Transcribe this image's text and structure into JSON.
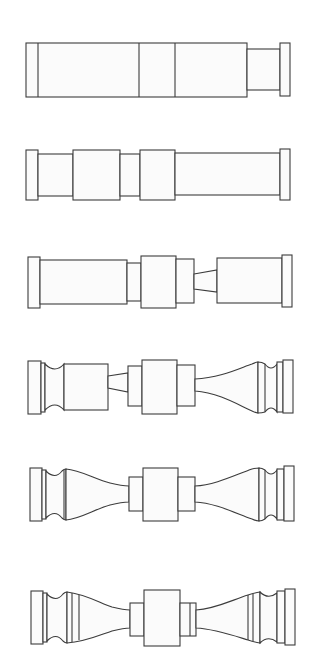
{
  "figure": {
    "stroke_color": "#3c3c3c",
    "fill_color": "#fbfbfb",
    "background": "#ffffff",
    "steps": [
      {
        "index": 1,
        "name": "blank-cylinder-stage"
      },
      {
        "index": 2,
        "name": "sectioned-cylinder-stage"
      },
      {
        "index": 3,
        "name": "tapered-neck-stage"
      },
      {
        "index": 4,
        "name": "one-side-curved-stage"
      },
      {
        "index": 5,
        "name": "both-sides-curved-stage"
      },
      {
        "index": 6,
        "name": "ringed-detail-stage"
      }
    ]
  }
}
